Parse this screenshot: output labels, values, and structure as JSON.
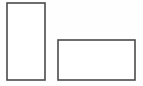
{
  "figure": {
    "canvas": {
      "width": 143,
      "height": 86,
      "background_color": "#fefefe"
    },
    "stroke": {
      "color": "#4a4a4a",
      "width": 1.6
    },
    "fill_color": "#ffffff",
    "shapes": [
      {
        "name": "portrait-rectangle",
        "label": "Tall rectangle",
        "orientation": "portrait",
        "x": 7,
        "y": 3,
        "width": 38,
        "height": 77,
        "stroke_color": "#4a4a4a",
        "stroke_width": 1.6,
        "fill_color": "#ffffff"
      },
      {
        "name": "landscape-rectangle",
        "label": "Wide rectangle",
        "orientation": "landscape",
        "x": 58,
        "y": 40,
        "width": 77,
        "height": 40,
        "stroke_color": "#4a4a4a",
        "stroke_width": 1.6,
        "fill_color": "#ffffff"
      }
    ],
    "shape_count": 2
  },
  "chart_data": {
    "type": "diagram",
    "xlabel": "",
    "ylabel": "",
    "categories": [
      "Tall rectangle",
      "Wide rectangle"
    ],
    "values": [
      {
        "name": "Tall rectangle",
        "width": 38,
        "height": 77
      },
      {
        "name": "Wide rectangle",
        "width": 77,
        "height": 40
      }
    ],
    "grid": false,
    "legend": "none"
  }
}
